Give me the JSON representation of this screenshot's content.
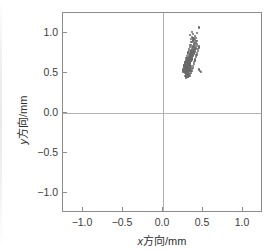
{
  "chart_data": {
    "type": "scatter",
    "title": "",
    "xlabel": "x方向/mm",
    "ylabel": "y方向/mm",
    "xlabel_var": "x",
    "xlabel_rest": "方向/mm",
    "ylabel_var": "y",
    "ylabel_rest": "方向/mm",
    "xlim": [
      -1.25,
      1.25
    ],
    "ylim": [
      -1.25,
      1.25
    ],
    "xticks": [
      -1.0,
      -0.5,
      0.0,
      0.5,
      1.0
    ],
    "yticks": [
      -1.0,
      -0.5,
      0.0,
      0.5,
      1.0
    ],
    "xticklabels": [
      "−1.0",
      "−0.5",
      "0.0",
      "0.5",
      "1.0"
    ],
    "yticklabels": [
      "−1.0",
      "−0.5",
      "0.0",
      "0.5",
      "1.0"
    ],
    "grid": "zero-lines-only",
    "gridlines": {
      "vertical_at": [
        0.0
      ],
      "horizontal_at": [
        0.0
      ]
    },
    "legend": "none",
    "marker_color": "#6a6a6a",
    "marker_size_px": 2.2,
    "series": [
      {
        "name": "measurements",
        "color": "#6a6a6a",
        "points": [
          [
            0.298,
            0.47
          ],
          [
            0.312,
            0.468
          ],
          [
            0.286,
            0.478
          ],
          [
            0.324,
            0.474
          ],
          [
            0.305,
            0.485
          ],
          [
            0.292,
            0.492
          ],
          [
            0.318,
            0.488
          ],
          [
            0.276,
            0.496
          ],
          [
            0.335,
            0.492
          ],
          [
            0.3,
            0.502
          ],
          [
            0.284,
            0.506
          ],
          [
            0.316,
            0.504
          ],
          [
            0.268,
            0.512
          ],
          [
            0.33,
            0.51
          ],
          [
            0.295,
            0.515
          ],
          [
            0.308,
            0.518
          ],
          [
            0.281,
            0.521
          ],
          [
            0.322,
            0.52
          ],
          [
            0.263,
            0.526
          ],
          [
            0.341,
            0.524
          ],
          [
            0.299,
            0.529
          ],
          [
            0.287,
            0.532
          ],
          [
            0.313,
            0.531
          ],
          [
            0.274,
            0.536
          ],
          [
            0.328,
            0.535
          ],
          [
            0.304,
            0.539
          ],
          [
            0.291,
            0.542
          ],
          [
            0.318,
            0.541
          ],
          [
            0.266,
            0.545
          ],
          [
            0.338,
            0.544
          ],
          [
            0.301,
            0.548
          ],
          [
            0.283,
            0.551
          ],
          [
            0.321,
            0.55
          ],
          [
            0.272,
            0.554
          ],
          [
            0.333,
            0.553
          ],
          [
            0.296,
            0.557
          ],
          [
            0.309,
            0.556
          ],
          [
            0.279,
            0.56
          ],
          [
            0.325,
            0.559
          ],
          [
            0.261,
            0.563
          ],
          [
            0.344,
            0.562
          ],
          [
            0.303,
            0.566
          ],
          [
            0.288,
            0.569
          ],
          [
            0.316,
            0.568
          ],
          [
            0.27,
            0.572
          ],
          [
            0.331,
            0.571
          ],
          [
            0.298,
            0.575
          ],
          [
            0.311,
            0.574
          ],
          [
            0.282,
            0.578
          ],
          [
            0.324,
            0.577
          ],
          [
            0.293,
            0.581
          ],
          [
            0.306,
            0.583
          ],
          [
            0.276,
            0.586
          ],
          [
            0.337,
            0.585
          ],
          [
            0.3,
            0.589
          ],
          [
            0.315,
            0.588
          ],
          [
            0.286,
            0.592
          ],
          [
            0.328,
            0.591
          ],
          [
            0.267,
            0.595
          ],
          [
            0.305,
            0.597
          ],
          [
            0.319,
            0.599
          ],
          [
            0.292,
            0.601
          ],
          [
            0.333,
            0.603
          ],
          [
            0.31,
            0.605
          ],
          [
            0.297,
            0.608
          ],
          [
            0.323,
            0.61
          ],
          [
            0.284,
            0.612
          ],
          [
            0.34,
            0.614
          ],
          [
            0.314,
            0.617
          ],
          [
            0.301,
            0.62
          ],
          [
            0.328,
            0.622
          ],
          [
            0.29,
            0.624
          ],
          [
            0.318,
            0.628
          ],
          [
            0.305,
            0.631
          ],
          [
            0.335,
            0.633
          ],
          [
            0.296,
            0.636
          ],
          [
            0.322,
            0.639
          ],
          [
            0.309,
            0.642
          ],
          [
            0.344,
            0.645
          ],
          [
            0.3,
            0.648
          ],
          [
            0.327,
            0.651
          ],
          [
            0.313,
            0.654
          ],
          [
            0.351,
            0.657
          ],
          [
            0.304,
            0.66
          ],
          [
            0.332,
            0.663
          ],
          [
            0.318,
            0.666
          ],
          [
            0.356,
            0.669
          ],
          [
            0.309,
            0.672
          ],
          [
            0.338,
            0.675
          ],
          [
            0.323,
            0.679
          ],
          [
            0.361,
            0.682
          ],
          [
            0.315,
            0.686
          ],
          [
            0.344,
            0.689
          ],
          [
            0.329,
            0.693
          ],
          [
            0.367,
            0.696
          ],
          [
            0.321,
            0.7
          ],
          [
            0.35,
            0.704
          ],
          [
            0.336,
            0.708
          ],
          [
            0.373,
            0.711
          ],
          [
            0.327,
            0.715
          ],
          [
            0.356,
            0.719
          ],
          [
            0.342,
            0.723
          ],
          [
            0.379,
            0.727
          ],
          [
            0.334,
            0.731
          ],
          [
            0.363,
            0.735
          ],
          [
            0.349,
            0.739
          ],
          [
            0.386,
            0.743
          ],
          [
            0.341,
            0.747
          ],
          [
            0.37,
            0.751
          ],
          [
            0.356,
            0.756
          ],
          [
            0.393,
            0.76
          ],
          [
            0.348,
            0.764
          ],
          [
            0.377,
            0.769
          ],
          [
            0.363,
            0.773
          ],
          [
            0.4,
            0.778
          ],
          [
            0.355,
            0.782
          ],
          [
            0.384,
            0.787
          ],
          [
            0.37,
            0.791
          ],
          [
            0.407,
            0.796
          ],
          [
            0.362,
            0.8
          ],
          [
            0.391,
            0.805
          ],
          [
            0.377,
            0.81
          ],
          [
            0.414,
            0.815
          ],
          [
            0.369,
            0.82
          ],
          [
            0.398,
            0.825
          ],
          [
            0.384,
            0.83
          ],
          [
            0.421,
            0.835
          ],
          [
            0.376,
            0.84
          ],
          [
            0.405,
            0.846
          ],
          [
            0.392,
            0.852
          ],
          [
            0.428,
            0.858
          ],
          [
            0.383,
            0.864
          ],
          [
            0.412,
            0.87
          ],
          [
            0.399,
            0.877
          ],
          [
            0.356,
            0.884
          ],
          [
            0.39,
            0.891
          ],
          [
            0.418,
            0.898
          ],
          [
            0.372,
            0.906
          ],
          [
            0.404,
            0.914
          ],
          [
            0.347,
            0.922
          ],
          [
            0.382,
            0.931
          ],
          [
            0.41,
            0.94
          ],
          [
            0.363,
            0.95
          ],
          [
            0.396,
            0.961
          ],
          [
            0.341,
            0.972
          ],
          [
            0.374,
            0.985
          ],
          [
            0.422,
            0.998
          ],
          [
            0.358,
            1.012
          ],
          [
            0.452,
            1.068
          ],
          [
            0.307,
            0.455
          ],
          [
            0.29,
            0.46
          ],
          [
            0.321,
            0.458
          ],
          [
            0.279,
            0.464
          ],
          [
            0.333,
            0.462
          ],
          [
            0.302,
            0.449
          ],
          [
            0.316,
            0.452
          ],
          [
            0.288,
            0.444
          ],
          [
            0.349,
            0.497
          ],
          [
            0.255,
            0.509
          ],
          [
            0.357,
            0.523
          ],
          [
            0.248,
            0.531
          ],
          [
            0.364,
            0.545
          ],
          [
            0.253,
            0.552
          ],
          [
            0.371,
            0.566
          ],
          [
            0.259,
            0.575
          ],
          [
            0.378,
            0.588
          ],
          [
            0.266,
            0.597
          ],
          [
            0.384,
            0.611
          ],
          [
            0.273,
            0.619
          ],
          [
            0.391,
            0.634
          ],
          [
            0.28,
            0.641
          ],
          [
            0.398,
            0.657
          ],
          [
            0.287,
            0.664
          ],
          [
            0.405,
            0.68
          ],
          [
            0.294,
            0.687
          ],
          [
            0.412,
            0.703
          ],
          [
            0.301,
            0.71
          ],
          [
            0.419,
            0.726
          ],
          [
            0.308,
            0.733
          ],
          [
            0.426,
            0.749
          ],
          [
            0.315,
            0.756
          ],
          [
            0.433,
            0.772
          ],
          [
            0.322,
            0.779
          ],
          [
            0.44,
            0.795
          ],
          [
            0.329,
            0.802
          ],
          [
            0.447,
            0.818
          ],
          [
            0.336,
            0.825
          ],
          [
            0.454,
            0.841
          ],
          [
            0.343,
            0.848
          ],
          [
            0.295,
            0.533
          ],
          [
            0.31,
            0.527
          ],
          [
            0.285,
            0.541
          ],
          [
            0.327,
            0.537
          ],
          [
            0.271,
            0.549
          ],
          [
            0.339,
            0.547
          ],
          [
            0.306,
            0.556
          ],
          [
            0.291,
            0.563
          ],
          [
            0.32,
            0.561
          ],
          [
            0.277,
            0.57
          ],
          [
            0.334,
            0.568
          ],
          [
            0.302,
            0.577
          ],
          [
            0.288,
            0.584
          ],
          [
            0.317,
            0.582
          ],
          [
            0.265,
            0.59
          ],
          [
            0.345,
            0.587
          ],
          [
            0.299,
            0.595
          ],
          [
            0.312,
            0.593
          ],
          [
            0.283,
            0.601
          ],
          [
            0.33,
            0.598
          ],
          [
            0.294,
            0.607
          ],
          [
            0.308,
            0.604
          ],
          [
            0.275,
            0.613
          ],
          [
            0.341,
            0.61
          ],
          [
            0.303,
            0.618
          ],
          [
            0.319,
            0.616
          ],
          [
            0.287,
            0.623
          ],
          [
            0.332,
            0.621
          ],
          [
            0.297,
            0.629
          ],
          [
            0.313,
            0.627
          ],
          [
            0.28,
            0.634
          ],
          [
            0.337,
            0.632
          ],
          [
            0.306,
            0.641
          ],
          [
            0.322,
            0.638
          ],
          [
            0.291,
            0.646
          ],
          [
            0.328,
            0.644
          ],
          [
            0.311,
            0.652
          ],
          [
            0.3,
            0.658
          ],
          [
            0.325,
            0.655
          ],
          [
            0.316,
            0.663
          ],
          [
            0.477,
            0.512
          ],
          [
            0.466,
            0.527
          ],
          [
            0.455,
            0.544
          ]
        ]
      }
    ]
  },
  "axes": {
    "x_tick_label_positions": [
      -1.0,
      -0.5,
      0.0,
      0.5,
      1.0
    ],
    "y_tick_label_positions": [
      -1.0,
      -0.5,
      0.0,
      0.5,
      1.0
    ]
  }
}
